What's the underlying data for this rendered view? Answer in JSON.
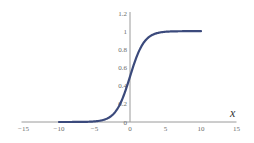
{
  "chart_data": {
    "type": "line",
    "title": "",
    "function": "sigmoid: y = 1 / (1 + e^(-x))",
    "xlabel": "x",
    "ylabel": "",
    "xlim": [
      -15,
      15
    ],
    "ylim": [
      0,
      1.2
    ],
    "x_ticks": [
      -15,
      -10,
      -5,
      0,
      5,
      10,
      15
    ],
    "x_tick_labels": [
      "−15",
      "−10",
      "−5",
      "0",
      "5",
      "10",
      "15"
    ],
    "y_ticks": [
      0,
      0.2,
      0.4,
      0.6,
      0.8,
      1,
      1.2
    ],
    "y_tick_labels": [
      "0",
      "0.2",
      "0.4",
      "0.6",
      "0.8",
      "1",
      "1.2"
    ],
    "grid": false,
    "legend": null,
    "series": [
      {
        "name": "sigmoid",
        "color": "#3b4a7c",
        "x": [
          -10,
          -8,
          -6,
          -5,
          -4,
          -3,
          -2,
          -1,
          0,
          1,
          2,
          3,
          4,
          5,
          6,
          8,
          10
        ],
        "values": [
          4.54e-05,
          0.000335,
          0.00247,
          0.00669,
          0.018,
          0.0474,
          0.119,
          0.269,
          0.5,
          0.731,
          0.881,
          0.953,
          0.982,
          0.993,
          0.998,
          0.9997,
          0.99995
        ]
      }
    ]
  },
  "colors": {
    "axis": "#9a9a9a",
    "tick_label": "#6b6b6b",
    "curve": "#3b4a7c",
    "background": "#ffffff"
  }
}
